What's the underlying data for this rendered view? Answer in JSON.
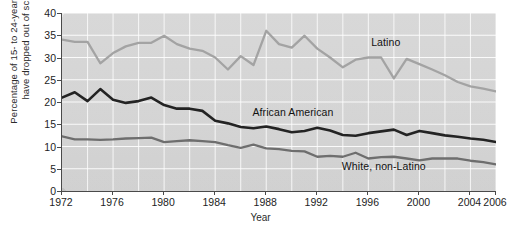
{
  "chart_data": {
    "type": "line",
    "title": "",
    "xlabel": "Year",
    "ylabel": "Percentage of 15- to 24-year-olds who have dropped out of school",
    "ylabel_lines": [
      "Percentage of 15- to  24-year-olds who",
      "have dropped out of school"
    ],
    "xlim": [
      1972,
      2006
    ],
    "ylim": [
      0,
      40
    ],
    "ytick_labels": [
      "0",
      "5",
      "10",
      "15",
      "20",
      "25",
      "30",
      "35",
      "40"
    ],
    "ytick_values": [
      0,
      5,
      10,
      15,
      20,
      25,
      30,
      35,
      40
    ],
    "xtick_labels": [
      "1972",
      "1976",
      "1980",
      "1984",
      "1988",
      "1992",
      "1996",
      "2000",
      "2004",
      "2006"
    ],
    "xtick_values": [
      1972,
      1976,
      1980,
      1984,
      1988,
      1992,
      1996,
      2000,
      2004,
      2006
    ],
    "grid": true,
    "grid_color": "#ffffff",
    "plot_background": "#cfcfcf",
    "legend_position": "inline-annotations",
    "x": [
      1972,
      1973,
      1974,
      1975,
      1976,
      1977,
      1978,
      1979,
      1980,
      1981,
      1982,
      1983,
      1984,
      1985,
      1986,
      1987,
      1988,
      1989,
      1990,
      1991,
      1992,
      1993,
      1994,
      1995,
      1996,
      1997,
      1998,
      1999,
      2000,
      2001,
      2002,
      2003,
      2004,
      2005,
      2006
    ],
    "series": [
      {
        "name": "Latino",
        "color": "#a3a3a3",
        "label_x": 1996.3,
        "label_y": 33.3,
        "values": [
          34.0,
          33.5,
          33.5,
          28.7,
          31.0,
          32.5,
          33.3,
          33.3,
          34.9,
          33.0,
          32.0,
          31.5,
          30.0,
          27.3,
          30.3,
          28.3,
          36.0,
          33.0,
          32.2,
          34.9,
          32.0,
          30.0,
          27.8,
          29.5,
          30.0,
          30.0,
          25.3,
          29.7,
          28.5,
          27.3,
          26.0,
          24.5,
          23.5,
          23.0,
          22.4
        ]
      },
      {
        "name": "African American",
        "color": "#232323",
        "label_x": 1987.0,
        "label_y": 17.6,
        "values": [
          21.0,
          22.2,
          20.2,
          22.9,
          20.5,
          19.8,
          20.2,
          21.0,
          19.3,
          18.5,
          18.5,
          18.0,
          15.8,
          15.2,
          14.4,
          14.1,
          14.5,
          13.9,
          13.2,
          13.5,
          14.2,
          13.6,
          12.6,
          12.4,
          13.0,
          13.4,
          13.8,
          12.6,
          13.5,
          13.0,
          12.5,
          12.2,
          11.8,
          11.5,
          11.0
        ]
      },
      {
        "name": "White, non-Latino",
        "color": "#6e6e6e",
        "label_x": 1994.0,
        "label_y": 5.3,
        "values": [
          12.3,
          11.6,
          11.6,
          11.5,
          11.6,
          11.8,
          11.9,
          12.0,
          11.0,
          11.2,
          11.4,
          11.2,
          11.0,
          10.3,
          9.7,
          10.4,
          9.6,
          9.4,
          9.0,
          8.9,
          7.7,
          7.9,
          7.7,
          8.6,
          7.3,
          7.6,
          7.7,
          7.3,
          6.9,
          7.3,
          7.3,
          7.3,
          6.8,
          6.5,
          6.0
        ]
      }
    ]
  }
}
